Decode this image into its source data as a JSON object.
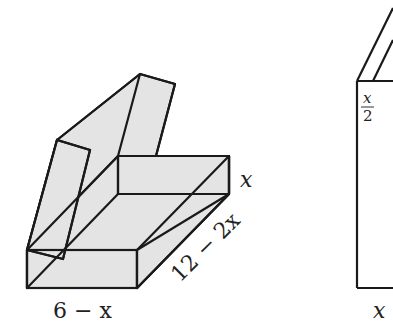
{
  "figure": {
    "left": {
      "description": "Open box formed by folding cardboard with flaps",
      "labels": {
        "width": "6 − x",
        "length": "12 − 2x",
        "height": "x"
      }
    },
    "right": {
      "description": "Side view of partially cropped panel",
      "labels": {
        "half_x": {
          "numerator": "x",
          "denominator": "2"
        },
        "bottom": "x"
      }
    },
    "colors": {
      "fill": "#e4e4e4",
      "stroke": "#1a1a1a",
      "background": "#ffffff"
    }
  }
}
